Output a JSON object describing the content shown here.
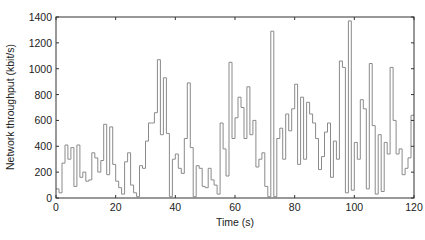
{
  "chart_data": {
    "type": "line",
    "style": "step",
    "title": "",
    "xlabel": "Time (s)",
    "ylabel": "Network throughput (kbit/s)",
    "xlim": [
      0,
      120
    ],
    "ylim": [
      0,
      1400
    ],
    "xticks": [
      0,
      20,
      40,
      60,
      80,
      100,
      120
    ],
    "yticks": [
      0,
      200,
      400,
      600,
      800,
      1000,
      1200,
      1400
    ],
    "grid": false,
    "legend": null,
    "line_color": "#8a8a8a",
    "axis_color": "#333333",
    "series": [
      {
        "name": "throughput",
        "x": [
          0,
          1,
          2,
          3,
          4,
          5,
          6,
          7,
          8,
          9,
          10,
          11,
          12,
          13,
          14,
          15,
          16,
          17,
          18,
          19,
          20,
          21,
          22,
          23,
          24,
          25,
          26,
          27,
          28,
          29,
          30,
          31,
          32,
          33,
          34,
          35,
          36,
          37,
          38,
          39,
          40,
          41,
          42,
          43,
          44,
          45,
          46,
          47,
          48,
          49,
          50,
          51,
          52,
          53,
          54,
          55,
          56,
          57,
          58,
          59,
          60,
          61,
          62,
          63,
          64,
          65,
          66,
          67,
          68,
          69,
          70,
          71,
          72,
          73,
          74,
          75,
          76,
          77,
          78,
          79,
          80,
          81,
          82,
          83,
          84,
          85,
          86,
          87,
          88,
          89,
          90,
          91,
          92,
          93,
          94,
          95,
          96,
          97,
          98,
          99,
          100,
          101,
          102,
          103,
          104,
          105,
          106,
          107,
          108,
          109,
          110,
          111,
          112,
          113,
          114,
          115,
          116,
          117,
          118,
          119
        ],
        "values": [
          70,
          40,
          270,
          410,
          300,
          390,
          90,
          410,
          160,
          200,
          130,
          140,
          350,
          310,
          200,
          290,
          570,
          180,
          550,
          260,
          130,
          80,
          30,
          280,
          350,
          100,
          40,
          10,
          250,
          230,
          440,
          580,
          580,
          660,
          1070,
          490,
          930,
          500,
          10,
          300,
          340,
          230,
          190,
          460,
          890,
          390,
          10,
          250,
          230,
          90,
          80,
          230,
          140,
          100,
          30,
          580,
          380,
          170,
          1050,
          460,
          620,
          780,
          700,
          460,
          860,
          490,
          600,
          240,
          300,
          350,
          90,
          10,
          1290,
          10,
          460,
          540,
          300,
          650,
          520,
          690,
          880,
          260,
          780,
          300,
          740,
          650,
          580,
          460,
          220,
          320,
          510,
          580,
          160,
          440,
          300,
          1060,
          1010,
          40,
          1370,
          60,
          430,
          300,
          760,
          690,
          70,
          1040,
          560,
          30,
          490,
          50,
          430,
          340,
          1010,
          600,
          340,
          380,
          180,
          230,
          310,
          640
        ]
      }
    ]
  }
}
